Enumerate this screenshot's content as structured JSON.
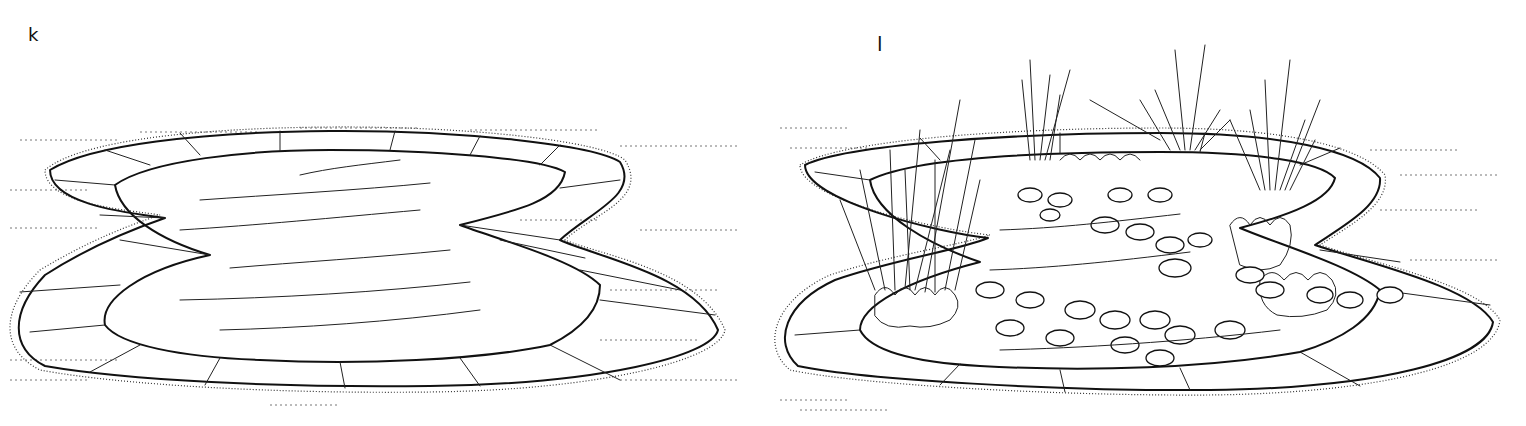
{
  "panels": [
    {
      "id": "k",
      "label": "k",
      "description": "Empty kidney-shaped pond with paved stone edging"
    },
    {
      "id": "l",
      "label": "l",
      "description": "Planted kidney-shaped pond with water lilies, reeds, irises and marginal plants"
    }
  ],
  "colors": {
    "ink": "#111111",
    "background": "#ffffff"
  }
}
